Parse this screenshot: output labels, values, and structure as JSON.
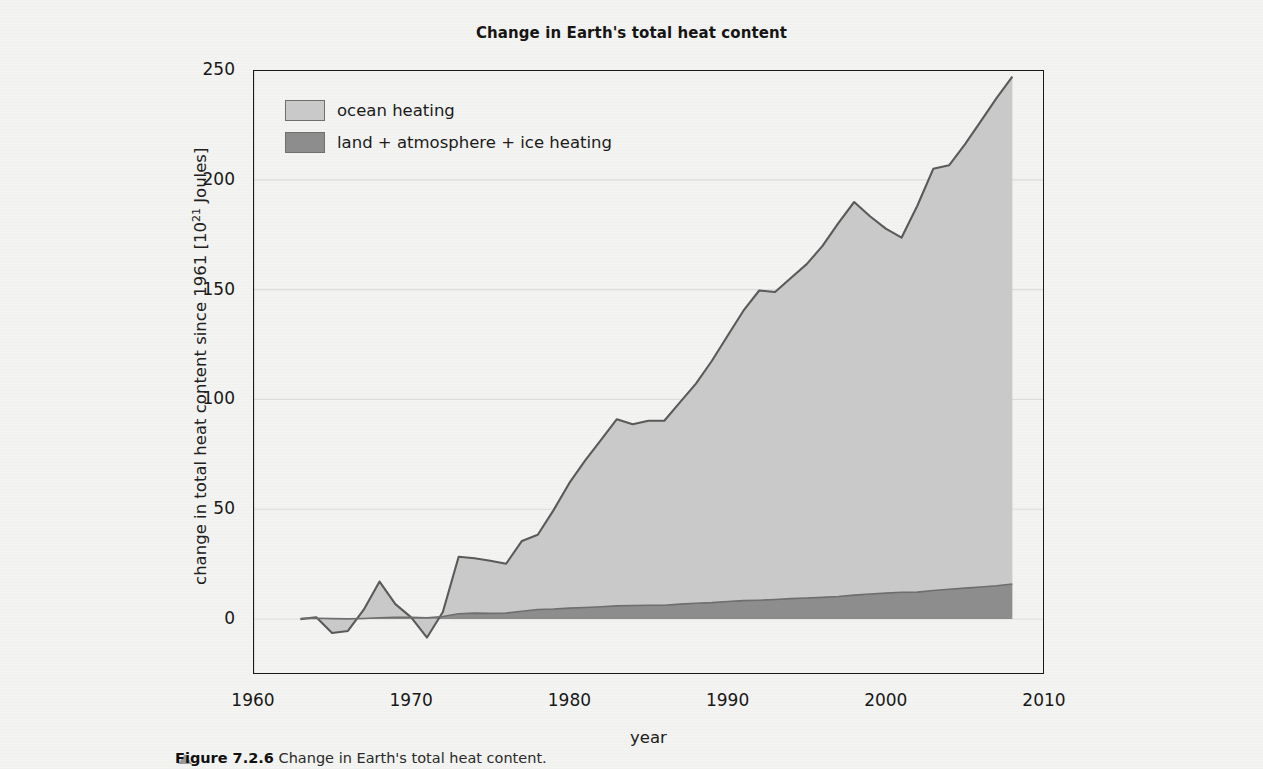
{
  "figure": {
    "title": "Change in Earth's total heat content",
    "caption_label": "Figure 7.2.6",
    "caption_text": "Change in Earth's total heat content."
  },
  "axes": {
    "ylabel_prefix": "change in total heat content since 1961 [10",
    "ylabel_exponent": "21",
    "ylabel_suffix": " Joules]",
    "xlabel": "year",
    "yticks": [
      0,
      50,
      100,
      150,
      200,
      250
    ],
    "xticks": [
      1960,
      1970,
      1980,
      1990,
      2000,
      2010
    ],
    "xminor": [
      1965,
      1975,
      1985,
      1995,
      2005
    ],
    "xlim": [
      1960,
      2010
    ],
    "ylim": [
      -25,
      250
    ]
  },
  "legend": {
    "position": "top-left",
    "items": [
      {
        "label": "ocean heating",
        "color": "#c9c9c9"
      },
      {
        "label": "land + atmosphere + ice heating",
        "color": "#8d8d8d"
      }
    ]
  },
  "colors": {
    "ocean": "#c9c9c9",
    "land_atm_ice": "#8d8d8d",
    "line": "#5a5a5a",
    "axis": "#1a1a1a",
    "grid": "#dcdcdc",
    "background": "#f3f3f1"
  },
  "chart_data": {
    "type": "area",
    "stacked": true,
    "title": "Change in Earth's total heat content",
    "xlabel": "year",
    "ylabel": "change in total heat content since 1961 [10^21 Joules]",
    "xlim": [
      1960,
      2010
    ],
    "ylim": [
      -25,
      250
    ],
    "grid": "horizontal",
    "legend": [
      "ocean heating",
      "land + atmosphere + ice heating"
    ],
    "x": [
      1963,
      1964,
      1965,
      1966,
      1967,
      1968,
      1969,
      1970,
      1971,
      1972,
      1973,
      1974,
      1975,
      1976,
      1977,
      1978,
      1979,
      1980,
      1981,
      1982,
      1983,
      1984,
      1985,
      1986,
      1987,
      1988,
      1989,
      1990,
      1991,
      1992,
      1993,
      1994,
      1995,
      1996,
      1997,
      1998,
      1999,
      2000,
      2001,
      2002,
      2003,
      2004,
      2005,
      2006,
      2007,
      2008
    ],
    "series": [
      {
        "name": "land + atmosphere + ice heating",
        "values": [
          0.3,
          0.4,
          0.2,
          0.1,
          0.3,
          0.6,
          0.8,
          0.8,
          0.6,
          1.2,
          2.4,
          2.7,
          2.6,
          2.7,
          3.6,
          4.4,
          4.6,
          5.0,
          5.3,
          5.6,
          6.0,
          6.2,
          6.3,
          6.3,
          6.8,
          7.2,
          7.5,
          8.0,
          8.4,
          8.6,
          8.9,
          9.3,
          9.6,
          9.9,
          10.3,
          10.9,
          11.4,
          11.8,
          12.2,
          12.3,
          13.0,
          13.6,
          14.1,
          14.6,
          15.2,
          16.0
        ]
      },
      {
        "name": "ocean heating",
        "values": [
          -0.3,
          0.4,
          -6.5,
          -5.5,
          4.0,
          16.5,
          6.0,
          0.0,
          -9.0,
          2.0,
          26.0,
          25.0,
          24.0,
          22.5,
          32.0,
          34.0,
          45.0,
          57.0,
          67.0,
          76.0,
          85.0,
          82.5,
          84.0,
          84.0,
          92.0,
          100.0,
          110.0,
          121.0,
          132.0,
          141.0,
          140.0,
          146.0,
          152.0,
          160.0,
          170.0,
          179.0,
          172.0,
          166.0,
          161.5,
          176.0,
          192.0,
          193.0,
          202.0,
          212.0,
          222.0,
          231.0
        ]
      }
    ]
  }
}
